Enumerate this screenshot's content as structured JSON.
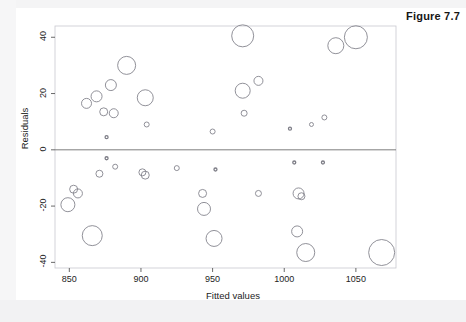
{
  "figure": {
    "label": "Figure 7.7"
  },
  "chart_data": {
    "type": "scatter",
    "title": "",
    "xlabel": "Fitted values",
    "ylabel": "Residuals",
    "xlim": [
      840,
      1078
    ],
    "ylim": [
      -42,
      44
    ],
    "xticks": [
      850,
      900,
      950,
      1000,
      1050
    ],
    "xtick_labels": [
      "850",
      "900",
      "950",
      "1000",
      "1050"
    ],
    "yticks": [
      40,
      20,
      0,
      -20,
      -40
    ],
    "ytick_labels": [
      "40",
      "20",
      "0",
      "-20",
      "-40"
    ],
    "grid": false,
    "legend": null,
    "reference_line": {
      "y": 0,
      "color": "#6e6e6e"
    },
    "marker": {
      "style": "open-circle",
      "fill": "none",
      "stroke": "#7d7d86",
      "size_encodes": "weight"
    },
    "points": [
      {
        "x": 849,
        "y": -19.5,
        "r": 7.0
      },
      {
        "x": 853,
        "y": -14.0,
        "r": 4.0
      },
      {
        "x": 856,
        "y": -15.5,
        "r": 4.5
      },
      {
        "x": 862,
        "y": 16.5,
        "r": 5.0
      },
      {
        "x": 866,
        "y": -30.5,
        "r": 10.0
      },
      {
        "x": 869,
        "y": 19.0,
        "r": 5.5
      },
      {
        "x": 871,
        "y": -8.5,
        "r": 3.5
      },
      {
        "x": 874,
        "y": 13.5,
        "r": 4.0
      },
      {
        "x": 876,
        "y": 4.5,
        "r": 1.5
      },
      {
        "x": 876,
        "y": -3.0,
        "r": 1.5
      },
      {
        "x": 879,
        "y": 23.0,
        "r": 5.5
      },
      {
        "x": 881,
        "y": 13.0,
        "r": 4.5
      },
      {
        "x": 882,
        "y": -6.0,
        "r": 2.5
      },
      {
        "x": 890,
        "y": 30.0,
        "r": 9.0
      },
      {
        "x": 901,
        "y": -8.0,
        "r": 3.5
      },
      {
        "x": 903,
        "y": 18.5,
        "r": 8.0
      },
      {
        "x": 903,
        "y": -9.0,
        "r": 4.0
      },
      {
        "x": 904,
        "y": 9.0,
        "r": 2.5
      },
      {
        "x": 925,
        "y": -6.5,
        "r": 2.5
      },
      {
        "x": 943,
        "y": -15.5,
        "r": 4.0
      },
      {
        "x": 944,
        "y": -21.0,
        "r": 6.5
      },
      {
        "x": 950,
        "y": 6.5,
        "r": 2.5
      },
      {
        "x": 951,
        "y": -31.5,
        "r": 8.0
      },
      {
        "x": 952,
        "y": -7.0,
        "r": 1.5
      },
      {
        "x": 971,
        "y": 40.5,
        "r": 11.0
      },
      {
        "x": 971,
        "y": 21.0,
        "r": 7.5
      },
      {
        "x": 972,
        "y": 13.0,
        "r": 3.0
      },
      {
        "x": 982,
        "y": 24.5,
        "r": 4.5
      },
      {
        "x": 982,
        "y": -15.5,
        "r": 3.0
      },
      {
        "x": 1004,
        "y": 7.5,
        "r": 1.5
      },
      {
        "x": 1007,
        "y": -4.5,
        "r": 1.5
      },
      {
        "x": 1009,
        "y": -29.0,
        "r": 5.5
      },
      {
        "x": 1010,
        "y": -15.5,
        "r": 5.5
      },
      {
        "x": 1012,
        "y": -16.5,
        "r": 3.5
      },
      {
        "x": 1015,
        "y": -36.5,
        "r": 9.0
      },
      {
        "x": 1019,
        "y": 9.0,
        "r": 2.0
      },
      {
        "x": 1027,
        "y": -4.5,
        "r": 1.5
      },
      {
        "x": 1028,
        "y": 11.5,
        "r": 2.5
      },
      {
        "x": 1036,
        "y": 37.0,
        "r": 8.0
      },
      {
        "x": 1050,
        "y": 40.0,
        "r": 11.5
      },
      {
        "x": 1068,
        "y": -36.5,
        "r": 13.0
      }
    ]
  },
  "axes": {
    "frame_color": "#c9c9cf",
    "plot_background": "#ffffff"
  }
}
